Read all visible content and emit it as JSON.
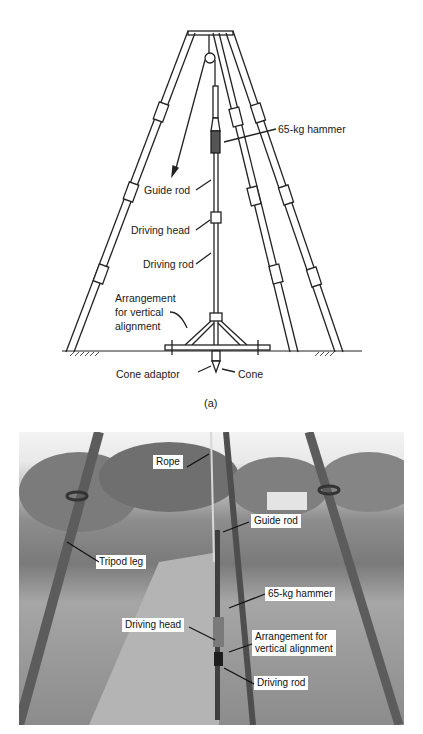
{
  "figure": {
    "drawing": {
      "caption": "(a)",
      "labels": {
        "hammer": "65-kg hammer",
        "guide_rod": "Guide rod",
        "driving_head": "Driving head",
        "driving_rod": "Driving rod",
        "alignment_1": "Arrangement",
        "alignment_2": "for vertical",
        "alignment_3": "alignment",
        "cone_adaptor": "Cone adaptor",
        "cone": "Cone"
      }
    },
    "photo": {
      "labels": {
        "rope": "Rope",
        "guide_rod": "Guide rod",
        "tripod_leg": "Tripod leg",
        "hammer": "65-kg hammer",
        "driving_head": "Driving head",
        "alignment": "Arrangement for\nvertical alignment",
        "driving_rod": "Driving rod"
      }
    }
  }
}
